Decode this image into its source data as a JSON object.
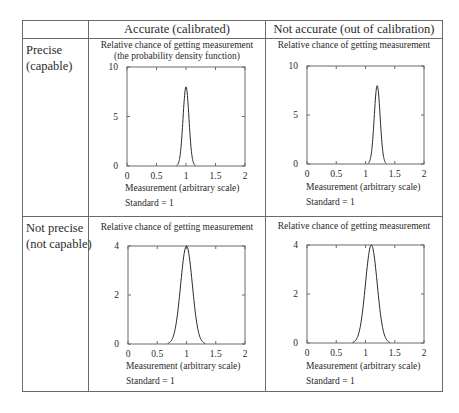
{
  "table": {
    "column_headers": [
      "",
      "Accurate (calibrated)",
      "Not accurate (out of calibration)"
    ],
    "row_labels": [
      "Precise\n(capable)",
      "Not precise\n(not capable)"
    ]
  },
  "cells": {
    "precise_accurate": {
      "caption_line1": "Relative chance of getting measurement",
      "caption_line2": "(the probability density function)",
      "xlabel": "Measurement (arbitrary scale)",
      "standard": "Standard = 1"
    },
    "precise_not_accurate": {
      "caption_line1": "Relative chance of getting measurement",
      "xlabel": "Measurement (arbitrary scale)",
      "standard": "Standard = 1"
    },
    "not_precise_accurate": {
      "caption_line1": "Relative chance of getting measurement",
      "xlabel": "Measurement (arbitrary scale)",
      "standard": "Standard = 1"
    },
    "not_precise_not_accurate": {
      "caption_line1": "Relative chance of getting measurement",
      "xlabel": "Measurement (arbitrary scale)",
      "standard": "Standard = 1"
    }
  },
  "colors": {
    "line": "#2a2a2a",
    "border": "#6a6a6a",
    "background": "#ffffff"
  },
  "chart_data": [
    {
      "type": "line",
      "title": "Precise, Accurate (calibrated)",
      "xlabel": "Measurement (arbitrary scale)",
      "ylabel": "Relative chance of getting measurement (the probability density function)",
      "xlim": [
        0,
        2
      ],
      "ylim": [
        0,
        10
      ],
      "xticks": [
        "0",
        "0.5",
        "1",
        "1.5",
        "2"
      ],
      "yticks": [
        "0",
        "5",
        "10"
      ],
      "distribution": "normal",
      "mean": 1.0,
      "std_dev": 0.05,
      "peak": 8.0,
      "x": [
        0.85,
        0.9,
        0.95,
        1.0,
        1.05,
        1.1,
        1.15
      ],
      "y": [
        0.09,
        1.08,
        4.85,
        8.0,
        4.85,
        1.08,
        0.09
      ],
      "annotation": "Standard = 1",
      "grid": false
    },
    {
      "type": "line",
      "title": "Precise, Not accurate (out of calibration)",
      "xlabel": "Measurement (arbitrary scale)",
      "ylabel": "Relative chance of getting measurement",
      "xlim": [
        0,
        2
      ],
      "ylim": [
        0,
        10
      ],
      "xticks": [
        "0",
        "0.5",
        "1",
        "1.5",
        "2"
      ],
      "yticks": [
        "0",
        "5",
        "10"
      ],
      "distribution": "normal",
      "mean": 1.2,
      "std_dev": 0.05,
      "peak": 8.0,
      "x": [
        1.05,
        1.1,
        1.15,
        1.2,
        1.25,
        1.3,
        1.35
      ],
      "y": [
        0.09,
        1.08,
        4.85,
        8.0,
        4.85,
        1.08,
        0.09
      ],
      "annotation": "Standard = 1",
      "grid": false
    },
    {
      "type": "line",
      "title": "Not precise, Accurate (calibrated)",
      "xlabel": "Measurement (arbitrary scale)",
      "ylabel": "Relative chance of getting measurement",
      "xlim": [
        0,
        2
      ],
      "ylim": [
        0,
        4
      ],
      "xticks": [
        "0",
        "0.5",
        "1",
        "1.5",
        "2"
      ],
      "yticks": [
        "0",
        "2",
        "4"
      ],
      "distribution": "normal",
      "mean": 1.0,
      "std_dev": 0.1,
      "peak": 4.0,
      "x": [
        0.7,
        0.8,
        0.9,
        1.0,
        1.1,
        1.2,
        1.3
      ],
      "y": [
        0.04,
        0.54,
        2.43,
        4.0,
        2.43,
        0.54,
        0.04
      ],
      "annotation": "Standard = 1",
      "grid": false
    },
    {
      "type": "line",
      "title": "Not precise, Not accurate (out of calibration)",
      "xlabel": "Measurement (arbitrary scale)",
      "ylabel": "Relative chance of getting measurement",
      "xlim": [
        0,
        2
      ],
      "ylim": [
        0,
        4
      ],
      "xticks": [
        "0",
        "0.5",
        "1",
        "1.5",
        "2"
      ],
      "yticks": [
        "0",
        "2",
        "4"
      ],
      "distribution": "normal",
      "mean": 1.1,
      "std_dev": 0.1,
      "peak": 4.0,
      "x": [
        0.8,
        0.9,
        1.0,
        1.1,
        1.2,
        1.3,
        1.4
      ],
      "y": [
        0.04,
        0.54,
        2.43,
        4.0,
        2.43,
        0.54,
        0.04
      ],
      "annotation": "Standard = 1",
      "grid": false
    }
  ]
}
